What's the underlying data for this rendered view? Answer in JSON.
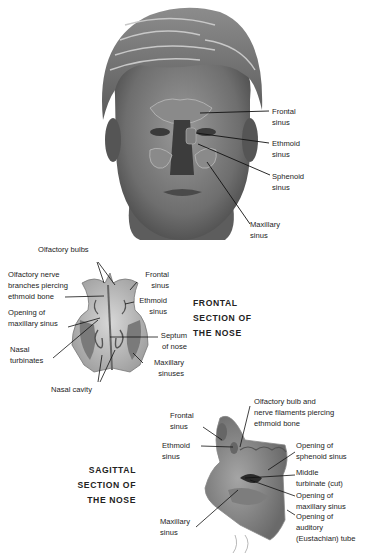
{
  "head_figure": {
    "labels": {
      "frontal": [
        "Frontal",
        "sinus"
      ],
      "ethmoid": [
        "Ethmoid",
        "sinus"
      ],
      "sphenoid": [
        "Sphenoid",
        "sinus"
      ],
      "maxillary": [
        "Maxillary",
        "sinus"
      ]
    }
  },
  "frontal_section": {
    "title": [
      "FRONTAL",
      "SECTION OF",
      "THE NOSE"
    ],
    "labels": {
      "olfactory_bulbs": "Olfactory bulbs",
      "olfactory_nerve": [
        "Olfactory nerve",
        "branches piercing",
        "ethmoid bone"
      ],
      "opening_maxillary": [
        "Opening of",
        "maxillary sinus"
      ],
      "nasal_turbinates": [
        "Nasal",
        "turbinates"
      ],
      "nasal_cavity": "Nasal cavity",
      "frontal_sinus": [
        "Frontal",
        "sinus"
      ],
      "ethmoid_sinus": [
        "Ethmoid",
        "sinus"
      ],
      "septum": [
        "Septum",
        "of nose"
      ],
      "maxillary_sinuses": [
        "Maxillary",
        "sinuses"
      ]
    }
  },
  "sagittal_section": {
    "title": [
      "SAGITTAL",
      "SECTION OF",
      "THE NOSE"
    ],
    "labels": {
      "frontal_sinus": [
        "Frontal",
        "sinus"
      ],
      "ethmoid_sinus": [
        "Ethmoid",
        "sinus"
      ],
      "maxillary_sinus": [
        "Maxillary",
        "sinus"
      ],
      "olfactory_bulb": [
        "Olfactory bulb and",
        "nerve filaments piercing",
        "ethmoid bone"
      ],
      "opening_sphenoid": [
        "Opening of",
        "sphenoid sinus"
      ],
      "middle_turbinate": [
        "Middle",
        "turbinate (cut)"
      ],
      "opening_maxillary": [
        "Opening of",
        "maxillary sinus"
      ],
      "opening_auditory": [
        "Opening of",
        "auditory",
        "(Eustachian) tube"
      ]
    }
  }
}
